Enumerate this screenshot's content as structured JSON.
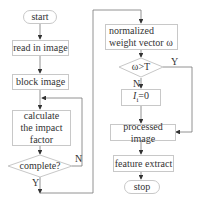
{
  "flowchart": {
    "nodes": {
      "start": "start",
      "read_image": "read in image",
      "block_image": "block image",
      "impact_factor": "calculate the impact factor",
      "complete": "complete?",
      "normalized": "normalized weight vector ω",
      "threshold": "ω>T",
      "set_zero_main": "I",
      "set_zero_sub": "i",
      "set_zero_rest": "=0",
      "processed": "processed image",
      "feature": "feature extract",
      "stop": "stop"
    },
    "edge_labels": {
      "complete_no": "N",
      "complete_yes": "Y",
      "threshold_yes": "Y",
      "threshold_no": "N"
    },
    "colors": {
      "line": "#555555",
      "border": "#c8c8c8",
      "text": "#333333"
    }
  }
}
